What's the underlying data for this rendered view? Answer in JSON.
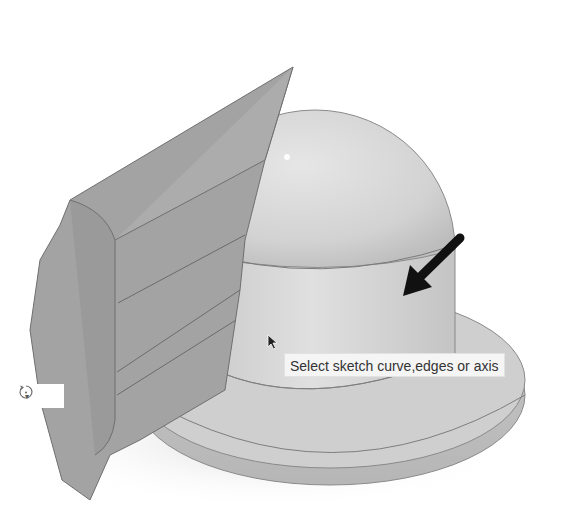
{
  "viewport": {
    "model": "3D model: dome on cylindrical body with flanged base and a swept/extruded side body",
    "background": "#ffffff",
    "body_color": "#d3d3d3",
    "side_body_color": "#9e9e9e",
    "edge_color": "#6f6f6f"
  },
  "tooltip": {
    "text": "Select sketch curve,edges or axis"
  },
  "annotation": {
    "arrow_icon": "arrow-down-left-icon",
    "arrow_color": "#111111"
  },
  "cursor": {
    "icon": "mouse-pointer-icon"
  },
  "orbit_control": {
    "icon": "orbit-icon",
    "dropdown_icon": "caret-down-icon",
    "caret": "▾"
  }
}
